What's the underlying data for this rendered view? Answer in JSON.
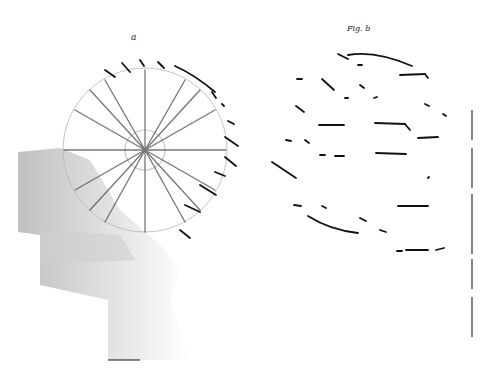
{
  "figure": {
    "left_panel": {
      "label": "a",
      "description": "grayscale rosette-like radial structure with shaded background"
    },
    "right_panel": {
      "label": "Fig. b",
      "description": "binarized line tracing of radial structure"
    },
    "colors": {
      "ink": "#111111",
      "shade": "#9a9a9a",
      "background": "#ffffff"
    }
  }
}
